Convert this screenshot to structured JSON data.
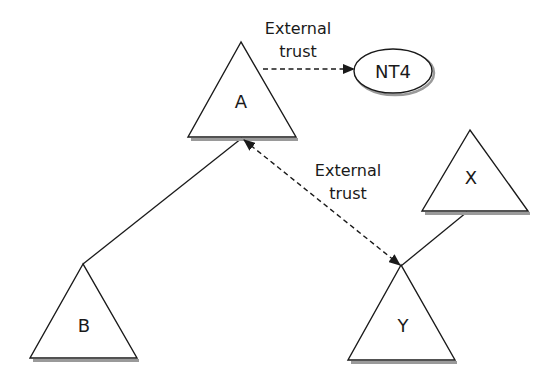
{
  "diagram": {
    "type": "trust-relationship-diagram",
    "colors": {
      "stroke": "#1a1a1a",
      "shadow": "#9a9a9a",
      "background": "#ffffff"
    },
    "nodes": [
      {
        "id": "A",
        "label": "A",
        "shape": "triangle"
      },
      {
        "id": "B",
        "label": "B",
        "shape": "triangle"
      },
      {
        "id": "X",
        "label": "X",
        "shape": "triangle"
      },
      {
        "id": "Y",
        "label": "Y",
        "shape": "triangle"
      },
      {
        "id": "NT4",
        "label": "NT4",
        "shape": "ellipse"
      }
    ],
    "edges": [
      {
        "from": "A",
        "to": "NT4",
        "style": "dashed",
        "direction": "one-way",
        "label_line1": "External",
        "label_line2": "trust"
      },
      {
        "from": "A",
        "to": "Y",
        "style": "dashed",
        "direction": "two-way",
        "label_line1": "External",
        "label_line2": "trust"
      },
      {
        "from": "A",
        "to": "B",
        "style": "solid",
        "direction": "none"
      },
      {
        "from": "X",
        "to": "Y",
        "style": "solid",
        "direction": "none"
      }
    ]
  }
}
